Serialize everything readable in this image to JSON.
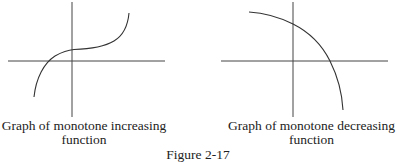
{
  "panels": [
    {
      "id": "increasing",
      "caption_line1": "Graph of monotone increasing",
      "caption_line2": "function",
      "curve": "monotone increasing cubic-like curve crossing x-axis left of origin"
    },
    {
      "id": "decreasing",
      "caption_line1": "Graph of monotone decreasing",
      "caption_line2": "function",
      "curve": "monotone decreasing concave-down arc crossing x-axis right of origin"
    }
  ],
  "figure_label": "Figure 2-17",
  "colors": {
    "stroke": "#333333",
    "background": "#ffffff"
  }
}
